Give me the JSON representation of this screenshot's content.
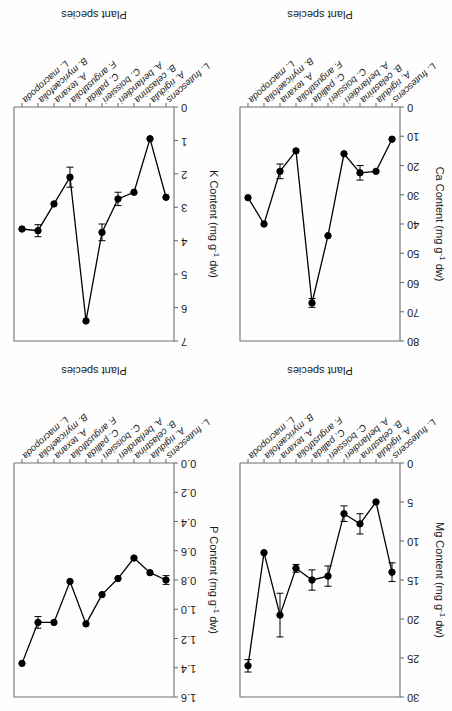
{
  "figure": {
    "orientation": "rotated-180",
    "layout": "2x2-grid",
    "species": [
      "L. frutescens",
      "A. rigidula",
      "B. celastrina",
      "A. berlandieri",
      "C. boissieri",
      "C. pallida",
      "F. angustifolia",
      "A. texana",
      "B. myricaefolia",
      "L. macropoda"
    ],
    "xlabel": "Plant species"
  },
  "chart_data": [
    {
      "id": "ca",
      "type": "line",
      "title": "",
      "ylabel": "Ca Content (mg g",
      "ylabel_sup": "-1",
      "ylabel_tail": " dw)",
      "xlabel": "Plant species",
      "categories": [
        "L. frutescens",
        "A. rigidula",
        "B. celastrina",
        "A. berlandieri",
        "C. boissieri",
        "C. pallida",
        "F. angustifolia",
        "A. texana",
        "B. myricaefolia",
        "L. macropoda"
      ],
      "values": [
        11,
        22,
        22.5,
        16,
        44,
        67,
        15,
        22,
        40,
        31
      ],
      "errors": [
        0,
        0,
        2.5,
        0,
        0,
        1.5,
        0,
        2.5,
        0,
        0
      ],
      "ylim": [
        0,
        80
      ],
      "yticks": [
        0,
        10,
        20,
        30,
        40,
        50,
        60,
        70,
        80
      ],
      "grid": false,
      "legend": "none"
    },
    {
      "id": "k",
      "type": "line",
      "title": "",
      "ylabel": "K Content (mg g",
      "ylabel_sup": "-1",
      "ylabel_tail": " dw)",
      "xlabel": "Plant species",
      "categories": [
        "L. frutescens",
        "A. rigidula",
        "B. celastrina",
        "A. berlandieri",
        "C. boissieri",
        "C. pallida",
        "F. angustifolia",
        "A. texana",
        "B. myricaefolia",
        "L. macropoda"
      ],
      "values": [
        2.7,
        0.95,
        2.55,
        2.75,
        3.75,
        6.4,
        2.1,
        2.9,
        3.7,
        3.65
      ],
      "errors": [
        0,
        0,
        0,
        0.2,
        0.25,
        0,
        0.3,
        0,
        0.18,
        0
      ],
      "ylim": [
        0,
        7
      ],
      "yticks": [
        0,
        1,
        2,
        3,
        4,
        5,
        6,
        7
      ],
      "grid": false,
      "legend": "none"
    },
    {
      "id": "mg",
      "type": "line",
      "title": "",
      "ylabel": "Mg Content (mg g",
      "ylabel_sup": "-1",
      "ylabel_tail": " dw)",
      "xlabel": "Plant species",
      "categories": [
        "L. frutescens",
        "A. rigidula",
        "B. celastrina",
        "A. berlandieri",
        "C. boissieri",
        "C. pallida",
        "F. angustifolia",
        "A. texana",
        "B. myricaefolia",
        "L. macropoda"
      ],
      "values": [
        14,
        5,
        7.8,
        6.5,
        14.5,
        15,
        13.5,
        19.5,
        11.5,
        26
      ],
      "errors": [
        1.2,
        0,
        1.3,
        1.0,
        1.3,
        1.3,
        0.5,
        2.8,
        0,
        0.8
      ],
      "ylim": [
        0,
        30
      ],
      "yticks": [
        0,
        5,
        10,
        15,
        20,
        25,
        30
      ],
      "grid": false,
      "legend": "none"
    },
    {
      "id": "p",
      "type": "line",
      "title": "",
      "ylabel": "P Content (mg g",
      "ylabel_sup": "-1",
      "ylabel_tail": " dw)",
      "xlabel": "Plant species",
      "categories": [
        "L. frutescens",
        "A. rigidula",
        "B. celastrina",
        "A. berlandieri",
        "C. boissieri",
        "C. pallida",
        "F. angustifolia",
        "A. texana",
        "B. myricaefolia",
        "L. macropoda"
      ],
      "values": [
        0.8,
        0.75,
        0.65,
        0.79,
        0.9,
        1.1,
        0.81,
        1.09,
        1.09,
        1.37
      ],
      "errors": [
        0.03,
        0,
        0,
        0,
        0,
        0,
        0,
        0,
        0.04,
        0
      ],
      "ylim": [
        0.0,
        1.6
      ],
      "yticks": [
        0.0,
        0.2,
        0.4,
        0.6,
        0.8,
        1.0,
        1.2,
        1.4,
        1.6
      ],
      "grid": false,
      "legend": "none"
    }
  ]
}
